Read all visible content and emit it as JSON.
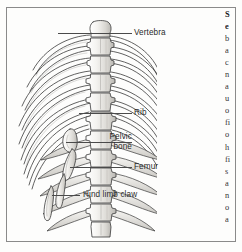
{
  "page": {
    "kind": "scanned-textbook-page",
    "ink_color": "#2b2b2b",
    "border_color": "#8a8a8a",
    "background": "#fdfdfc"
  },
  "figure": {
    "caption_alt": "Dorsal view of a vertebral column with ribs, pelvic bone, femur and hind limb claw",
    "labels": [
      {
        "id": "vertebra",
        "text": "Vertebra",
        "top": 28,
        "leader_top": 33,
        "leader_left": 58,
        "leader_width": 74
      },
      {
        "id": "rib",
        "text": "Rib",
        "top": 108,
        "leader_top": 113,
        "leader_left": 79,
        "leader_width": 53
      },
      {
        "id": "pelvic-bone-1",
        "text": "Pelvic",
        "top": 132,
        "leader_top": 142,
        "leader_left": 66,
        "leader_width": 66
      },
      {
        "id": "pelvic-bone-2",
        "text": "bone",
        "top": 142,
        "leader_top": 0,
        "leader_left": 0,
        "leader_width": 0
      },
      {
        "id": "femur",
        "text": "Femur",
        "top": 162,
        "leader_top": 167,
        "leader_left": 70,
        "leader_width": 62
      },
      {
        "id": "hind-limb-claw",
        "text": "Hind limb claw",
        "top": 190,
        "leader_top": 195,
        "leader_left": 52,
        "leader_width": 28
      }
    ]
  },
  "text_column": {
    "note": "right-hand body-text column is cropped by the image edge; only the leading glyph of each line is visible",
    "lines": [
      {
        "t": "S",
        "bold": true
      },
      {
        "t": "e",
        "bold": true
      },
      {
        "t": "b",
        "bold": false
      },
      {
        "t": "a",
        "bold": false
      },
      {
        "t": "c",
        "bold": false
      },
      {
        "t": "n",
        "bold": false
      },
      {
        "t": "a",
        "bold": false
      },
      {
        "t": "u",
        "bold": false
      },
      {
        "t": "o",
        "bold": false
      },
      {
        "t": "fi",
        "bold": false
      },
      {
        "t": "o",
        "bold": false
      },
      {
        "t": "h",
        "bold": false
      },
      {
        "t": "fi",
        "bold": false
      },
      {
        "t": "s",
        "bold": false
      },
      {
        "t": "a",
        "bold": false
      },
      {
        "t": "n",
        "bold": false
      },
      {
        "t": "o",
        "bold": false
      },
      {
        "t": "a",
        "bold": false
      }
    ]
  }
}
